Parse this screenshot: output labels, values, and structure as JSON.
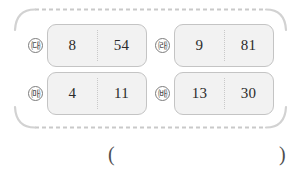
{
  "frame": {
    "style": "dashed-rounded-rectangle",
    "border_color": "#c9c9c9",
    "corner_color": "#d2d2d2"
  },
  "cards": [
    {
      "marker": "㈐",
      "marker_name": "marker-giyeok",
      "left_value": "8",
      "right_value": "54"
    },
    {
      "marker": "㈑",
      "marker_name": "marker-nieun",
      "left_value": "9",
      "right_value": "81"
    },
    {
      "marker": "㈒",
      "marker_name": "marker-digeut",
      "left_value": "4",
      "right_value": "11"
    },
    {
      "marker": "㈓",
      "marker_name": "marker-rieul",
      "left_value": "13",
      "right_value": "30"
    }
  ],
  "answer": {
    "open_paren": "(",
    "close_paren": ")",
    "value": ""
  },
  "colors": {
    "card_fill": "#f2f2f2",
    "card_border": "#c4c4c4",
    "divider": "#c9c9c9",
    "text": "#2b2b2b"
  }
}
